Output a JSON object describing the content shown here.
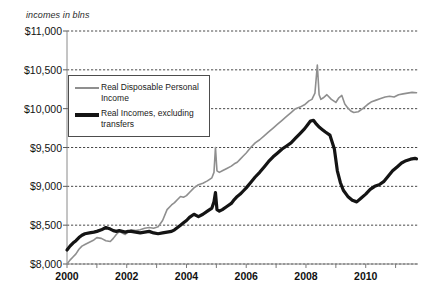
{
  "axis_caption": "incomes in blns",
  "legend": {
    "position": "upper-left-inside",
    "entries": [
      {
        "label": "Real Disposable Personal Income",
        "color": "#8f8f8f",
        "style": "thin-gray-line"
      },
      {
        "label": "Real Incomes, excluding transfers",
        "color": "#141414",
        "style": "thick-black-line"
      }
    ]
  },
  "chart_data": {
    "type": "line",
    "title": "",
    "subtitle": "",
    "xlabel": "",
    "ylabel": "incomes in blns",
    "xlim": [
      2000,
      2011.75
    ],
    "ylim": [
      8000,
      11000
    ],
    "ytick_step": 500,
    "grid": true,
    "yticks": [
      8000,
      8500,
      9000,
      9500,
      10000,
      10500,
      11000
    ],
    "ytick_labels": [
      "$8,000",
      "$8,500",
      "$9,000",
      "$9,500",
      "$10,000",
      "$10,500",
      "$11,000"
    ],
    "xticks": [
      2000,
      2002,
      2004,
      2006,
      2008,
      2010
    ],
    "xtick_labels": [
      "2000",
      "2002",
      "2004",
      "2006",
      "2008",
      "2010"
    ],
    "xminor_ticks": [
      2001,
      2003,
      2005,
      2007,
      2009,
      2011
    ],
    "series": [
      {
        "name": "Real Disposable Personal Income",
        "color": "#8f8f8f",
        "width": 1.6,
        "x": [
          2000.0,
          2000.1,
          2000.2,
          2000.3,
          2000.4,
          2000.5,
          2000.6,
          2000.75,
          2000.9,
          2001.0,
          2001.15,
          2001.3,
          2001.45,
          2001.55,
          2001.65,
          2001.75,
          2001.85,
          2001.95,
          2002.05,
          2002.15,
          2002.3,
          2002.45,
          2002.6,
          2002.75,
          2002.9,
          2003.05,
          2003.2,
          2003.35,
          2003.5,
          2003.6,
          2003.7,
          2003.8,
          2003.9,
          2004.0,
          2004.1,
          2004.25,
          2004.4,
          2004.55,
          2004.7,
          2004.85,
          2004.92,
          2004.97,
          2005.02,
          2005.1,
          2005.2,
          2005.35,
          2005.5,
          2005.6,
          2005.7,
          2005.8,
          2005.9,
          2006.0,
          2006.15,
          2006.3,
          2006.45,
          2006.6,
          2006.75,
          2006.9,
          2007.05,
          2007.2,
          2007.35,
          2007.5,
          2007.65,
          2007.8,
          2007.95,
          2008.1,
          2008.2,
          2008.3,
          2008.38,
          2008.44,
          2008.5,
          2008.58,
          2008.7,
          2008.85,
          2009.0,
          2009.1,
          2009.2,
          2009.3,
          2009.4,
          2009.5,
          2009.6,
          2009.75,
          2009.9,
          2010.05,
          2010.2,
          2010.35,
          2010.5,
          2010.65,
          2010.8,
          2010.95,
          2011.1,
          2011.25,
          2011.4,
          2011.55,
          2011.7
        ],
        "y": [
          8000,
          8050,
          8090,
          8130,
          8190,
          8230,
          8250,
          8280,
          8310,
          8340,
          8330,
          8300,
          8290,
          8330,
          8380,
          8420,
          8400,
          8380,
          8420,
          8440,
          8430,
          8440,
          8460,
          8470,
          8460,
          8480,
          8560,
          8700,
          8760,
          8790,
          8830,
          8870,
          8860,
          8880,
          8920,
          8980,
          9020,
          9040,
          9070,
          9110,
          9180,
          9500,
          9200,
          9180,
          9200,
          9230,
          9260,
          9290,
          9310,
          9350,
          9390,
          9430,
          9500,
          9560,
          9600,
          9650,
          9700,
          9750,
          9800,
          9850,
          9900,
          9950,
          10000,
          10020,
          10050,
          10100,
          10120,
          10200,
          10560,
          10180,
          10120,
          10140,
          10180,
          10120,
          10080,
          10140,
          10170,
          10060,
          10010,
          9970,
          9950,
          9960,
          10000,
          10050,
          10090,
          10110,
          10130,
          10150,
          10160,
          10150,
          10180,
          10190,
          10200,
          10210,
          10205
        ]
      },
      {
        "name": "Real Incomes, excluding transfers",
        "color": "#141414",
        "width": 3.2,
        "x": [
          2000.0,
          2000.1,
          2000.2,
          2000.3,
          2000.4,
          2000.5,
          2000.6,
          2000.75,
          2000.9,
          2001.0,
          2001.15,
          2001.3,
          2001.45,
          2001.55,
          2001.65,
          2001.75,
          2001.85,
          2001.95,
          2002.05,
          2002.15,
          2002.3,
          2002.45,
          2002.6,
          2002.75,
          2002.9,
          2003.05,
          2003.2,
          2003.35,
          2003.5,
          2003.6,
          2003.7,
          2003.8,
          2003.9,
          2004.0,
          2004.1,
          2004.25,
          2004.4,
          2004.55,
          2004.7,
          2004.85,
          2004.92,
          2004.97,
          2005.02,
          2005.1,
          2005.2,
          2005.35,
          2005.5,
          2005.6,
          2005.7,
          2005.8,
          2005.9,
          2006.0,
          2006.15,
          2006.3,
          2006.45,
          2006.6,
          2006.75,
          2006.9,
          2007.05,
          2007.2,
          2007.35,
          2007.5,
          2007.65,
          2007.8,
          2007.95,
          2008.05,
          2008.15,
          2008.25,
          2008.35,
          2008.45,
          2008.55,
          2008.65,
          2008.8,
          2008.95,
          2009.05,
          2009.15,
          2009.25,
          2009.4,
          2009.55,
          2009.7,
          2009.85,
          2010.0,
          2010.15,
          2010.3,
          2010.45,
          2010.6,
          2010.75,
          2010.9,
          2011.05,
          2011.2,
          2011.35,
          2011.5,
          2011.65,
          2011.7
        ],
        "y": [
          8180,
          8230,
          8270,
          8300,
          8340,
          8370,
          8390,
          8400,
          8410,
          8420,
          8440,
          8470,
          8450,
          8430,
          8420,
          8430,
          8420,
          8410,
          8420,
          8420,
          8410,
          8400,
          8410,
          8420,
          8400,
          8390,
          8400,
          8410,
          8420,
          8440,
          8470,
          8500,
          8530,
          8560,
          8600,
          8640,
          8610,
          8640,
          8680,
          8720,
          8800,
          8920,
          8700,
          8680,
          8700,
          8740,
          8780,
          8830,
          8870,
          8900,
          8940,
          8980,
          9050,
          9120,
          9180,
          9250,
          9320,
          9380,
          9430,
          9480,
          9520,
          9560,
          9620,
          9680,
          9740,
          9790,
          9840,
          9850,
          9800,
          9760,
          9730,
          9700,
          9660,
          9480,
          9200,
          9050,
          8950,
          8870,
          8820,
          8800,
          8850,
          8900,
          8960,
          9000,
          9020,
          9060,
          9130,
          9200,
          9250,
          9300,
          9330,
          9350,
          9360,
          9355
        ]
      }
    ]
  }
}
